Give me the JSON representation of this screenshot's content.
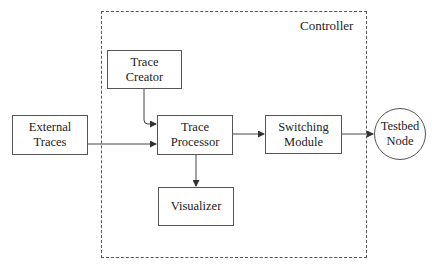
{
  "diagram": {
    "container": {
      "label": "Controller"
    },
    "nodes": {
      "trace_creator": {
        "label": "Trace\nCreator"
      },
      "external_traces": {
        "label": "External Traces"
      },
      "trace_processor": {
        "label": "Trace\nProcessor"
      },
      "switching_module": {
        "label": "Switching\nModule"
      },
      "visualizer": {
        "label": "Visualizer"
      },
      "testbed_node": {
        "label": "Testbed\nNode"
      }
    },
    "edges": [
      {
        "from": "Trace Creator",
        "to": "Trace Processor"
      },
      {
        "from": "External Traces",
        "to": "Trace Processor"
      },
      {
        "from": "Trace Processor",
        "to": "Switching Module"
      },
      {
        "from": "Trace Processor",
        "to": "Visualizer"
      },
      {
        "from": "Switching Module",
        "to": "Testbed Node"
      }
    ]
  }
}
